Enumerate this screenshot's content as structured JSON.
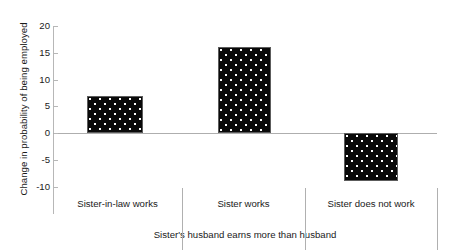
{
  "chart_data": {
    "type": "bar",
    "title": "",
    "subtitle": "",
    "xlabel": "Sister's husband earns more than husband",
    "ylabel": "Change in probability of being employed",
    "categories": [
      "Sister-in-law works",
      "Sister works",
      "Sister does not work"
    ],
    "values": [
      7,
      16,
      -9
    ],
    "series": [
      {
        "name": "Change in probability of being employed",
        "values": [
          7,
          16,
          -9
        ]
      }
    ],
    "ylim": [
      -10,
      20
    ],
    "yticks": [
      -10,
      -5,
      0,
      5,
      10,
      15,
      20
    ],
    "ytick_labels": [
      "-10",
      "-5",
      "0",
      "5",
      "10",
      "15",
      "20"
    ],
    "grid": false,
    "legend": false,
    "legend_position": "none",
    "bar_fill_color": "#0a0a0a",
    "bar_pattern": "white-dots",
    "axis_color": "#b0b0b0",
    "background_color": "#ffffff"
  },
  "axis": {
    "y_title": "Change in probability of being employed",
    "group_caption": "Sister's husband earns more than husband"
  }
}
